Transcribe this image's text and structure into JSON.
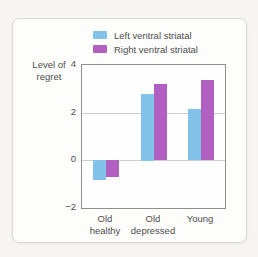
{
  "chart_data": {
    "type": "bar",
    "title": "",
    "ylabel": "Level of\nregret",
    "xlabel": "",
    "categories": [
      "Old\nhealthy",
      "Old\ndepressed",
      "Young"
    ],
    "series": [
      {
        "name": "Left ventral striatal",
        "color": "#82c2e9",
        "values": [
          -0.85,
          2.8,
          2.15
        ]
      },
      {
        "name": "Right ventral striatal",
        "color": "#b160c2",
        "values": [
          -0.7,
          3.2,
          3.35
        ]
      }
    ],
    "ylim": [
      -2,
      4
    ],
    "yticks": [
      4,
      2,
      0,
      -2
    ],
    "grid": true,
    "legend_position": "top-right",
    "bar_baseline": 0
  },
  "colors": {
    "left_bar": "#82c2e9",
    "right_bar": "#b160c2",
    "axis": "#8f8f8f",
    "gridline": "#cfcecb",
    "text": "#4d4d4d"
  }
}
